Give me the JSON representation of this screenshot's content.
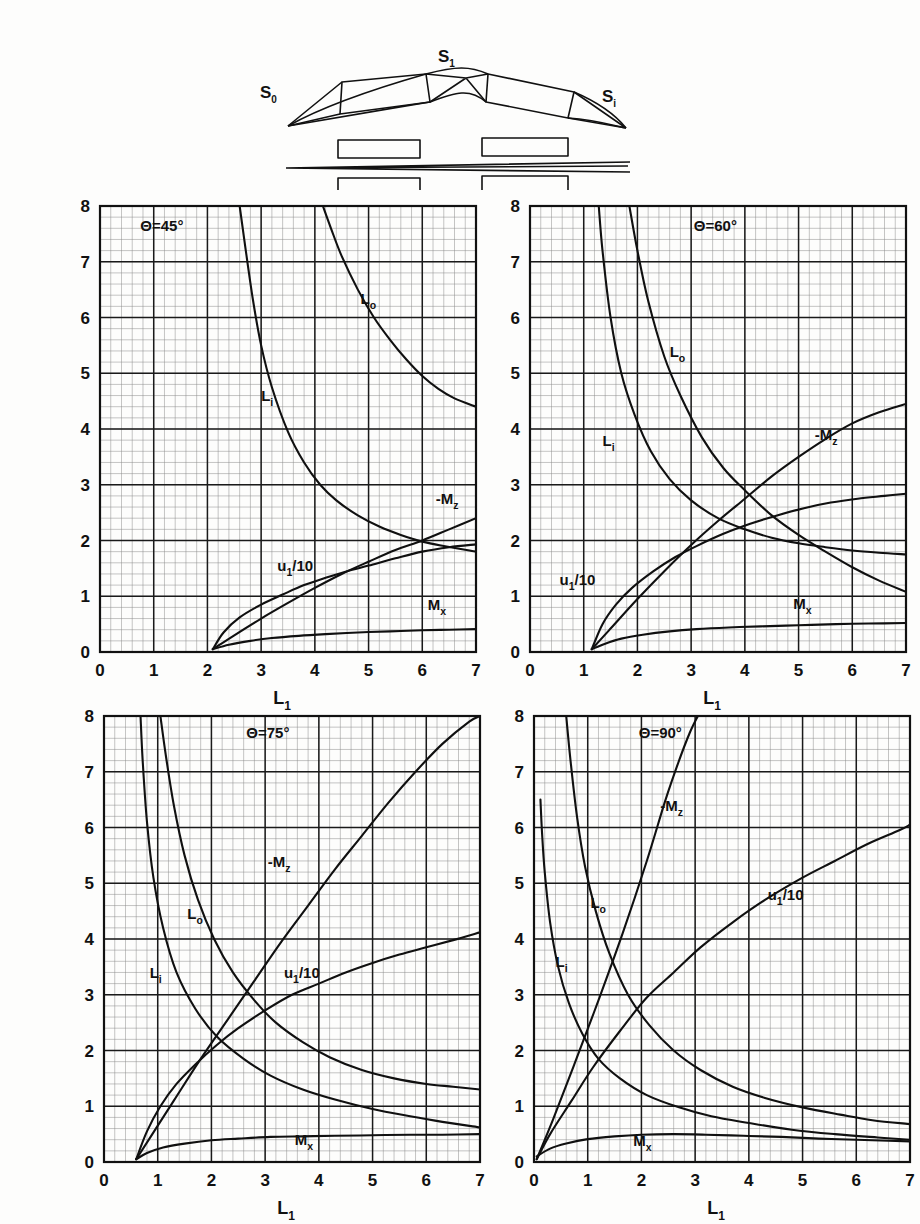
{
  "figure": {
    "schematic": {
      "labels": [
        {
          "name": "s-zero",
          "text": "S",
          "sub": "0",
          "x": 30,
          "y": 58
        },
        {
          "name": "s-one",
          "text": "S",
          "sub": "1",
          "x": 208,
          "y": 22
        },
        {
          "name": "s-i",
          "text": "S",
          "sub": "i",
          "x": 372,
          "y": 62
        }
      ]
    },
    "axis": {
      "x_label": "L",
      "x_label_sub": "1",
      "x_ticks": [
        "0",
        "1",
        "2",
        "3",
        "4",
        "5",
        "6",
        "7"
      ],
      "y_ticks": [
        "0",
        "1",
        "2",
        "3",
        "4",
        "5",
        "6",
        "7",
        "8"
      ],
      "x_min": 0,
      "x_max": 7,
      "y_min": 0,
      "y_max": 8,
      "minor_per_major": 5,
      "grid": "on"
    },
    "curve_names": {
      "lo": {
        "text": "L",
        "sub": "o"
      },
      "li": {
        "text": "L",
        "sub": "i"
      },
      "mz": {
        "text": "-M",
        "sub": "z"
      },
      "u1": {
        "text": "u",
        "sub": "1",
        "suffix": "/10"
      },
      "mx": {
        "text": "M",
        "sub": "x"
      }
    },
    "line_color": "#101010",
    "grid_major_color": "#1a1a1a",
    "grid_minor_color": "#8a8a8a"
  },
  "chart_data": [
    {
      "type": "line",
      "title": "Θ=45°",
      "theta": 45,
      "xlabel": "L₁",
      "ylabel": "",
      "xlim": [
        0,
        7
      ],
      "ylim": [
        0,
        8
      ],
      "grid": true,
      "origin_x": 2.1,
      "label_positions": {
        "theta": {
          "x": 0.75,
          "y": 7.55
        },
        "lo": {
          "x": 4.85,
          "y": 6.25
        },
        "li": {
          "x": 3.0,
          "y": 4.5
        },
        "mz": {
          "x": 6.25,
          "y": 2.65
        },
        "u1": {
          "x": 3.3,
          "y": 1.45
        },
        "mx": {
          "x": 6.1,
          "y": 0.75
        }
      },
      "series": [
        {
          "name": "L₀",
          "key": "lo",
          "x": [
            4.15,
            4.3,
            4.5,
            4.8,
            5.1,
            5.4,
            5.7,
            6.0,
            6.3,
            6.6,
            7.0
          ],
          "values": [
            8.0,
            7.6,
            7.1,
            6.5,
            6.0,
            5.6,
            5.25,
            4.95,
            4.72,
            4.55,
            4.4
          ]
        },
        {
          "name": "Lᵢ",
          "key": "li",
          "x": [
            2.6,
            2.7,
            2.85,
            3.0,
            3.2,
            3.5,
            3.8,
            4.1,
            4.4,
            4.8,
            5.2,
            5.6,
            6.0,
            6.4,
            7.0
          ],
          "values": [
            8.0,
            7.3,
            6.3,
            5.5,
            4.75,
            3.95,
            3.4,
            3.0,
            2.72,
            2.45,
            2.25,
            2.1,
            1.98,
            1.9,
            1.8
          ]
        },
        {
          "name": "-M_z",
          "key": "mz",
          "x": [
            2.1,
            2.5,
            3.0,
            3.5,
            4.0,
            4.5,
            5.0,
            5.5,
            6.0,
            6.5,
            7.0
          ],
          "values": [
            0.05,
            0.3,
            0.6,
            0.88,
            1.15,
            1.4,
            1.62,
            1.83,
            2.0,
            2.2,
            2.4
          ]
        },
        {
          "name": "u₁/10",
          "key": "u1",
          "x": [
            2.1,
            2.3,
            2.6,
            3.0,
            3.4,
            3.8,
            4.2,
            4.6,
            5.0,
            5.5,
            6.0,
            6.5,
            7.0
          ],
          "values": [
            0.05,
            0.35,
            0.62,
            0.85,
            1.03,
            1.2,
            1.33,
            1.45,
            1.55,
            1.68,
            1.8,
            1.88,
            1.93
          ]
        },
        {
          "name": "M_x",
          "key": "mx",
          "x": [
            2.1,
            2.4,
            2.8,
            3.2,
            3.7,
            4.2,
            4.8,
            5.4,
            6.0,
            6.5,
            7.0
          ],
          "values": [
            0.05,
            0.13,
            0.2,
            0.25,
            0.29,
            0.32,
            0.35,
            0.37,
            0.39,
            0.4,
            0.41
          ]
        }
      ]
    },
    {
      "type": "line",
      "title": "Θ=60°",
      "theta": 60,
      "xlabel": "L₁",
      "ylabel": "",
      "xlim": [
        0,
        7
      ],
      "ylim": [
        0,
        8
      ],
      "grid": true,
      "origin_x": 1.15,
      "label_positions": {
        "theta": {
          "x": 3.05,
          "y": 7.55
        },
        "lo": {
          "x": 2.6,
          "y": 5.3
        },
        "li": {
          "x": 1.35,
          "y": 3.7
        },
        "mz": {
          "x": 5.3,
          "y": 3.8
        },
        "u1": {
          "x": 0.55,
          "y": 1.2
        },
        "mx": {
          "x": 4.9,
          "y": 0.78
        }
      },
      "series": [
        {
          "name": "L₀",
          "key": "lo",
          "x": [
            1.85,
            2.0,
            2.2,
            2.5,
            2.8,
            3.2,
            3.6,
            4.0,
            4.5,
            5.0,
            5.5,
            6.0,
            6.5,
            7.0
          ],
          "values": [
            8.0,
            7.2,
            6.3,
            5.3,
            4.6,
            3.85,
            3.3,
            2.9,
            2.45,
            2.1,
            1.8,
            1.52,
            1.28,
            1.08
          ]
        },
        {
          "name": "Lᵢ",
          "key": "li",
          "x": [
            1.28,
            1.35,
            1.5,
            1.7,
            1.95,
            2.25,
            2.6,
            3.0,
            3.5,
            4.0,
            4.5,
            5.0,
            5.5,
            6.0,
            6.5,
            7.0
          ],
          "values": [
            8.0,
            7.2,
            6.0,
            5.0,
            4.25,
            3.6,
            3.1,
            2.72,
            2.4,
            2.2,
            2.05,
            1.95,
            1.88,
            1.82,
            1.78,
            1.75
          ]
        },
        {
          "name": "-M_z",
          "key": "mz",
          "x": [
            1.15,
            1.5,
            2.0,
            2.5,
            3.0,
            3.5,
            4.0,
            4.5,
            5.0,
            5.5,
            6.0,
            6.5,
            7.0
          ],
          "values": [
            0.05,
            0.42,
            0.95,
            1.45,
            1.92,
            2.35,
            2.75,
            3.15,
            3.5,
            3.82,
            4.1,
            4.3,
            4.45
          ]
        },
        {
          "name": "u₁/10",
          "key": "u1",
          "x": [
            1.15,
            1.35,
            1.6,
            1.9,
            2.3,
            2.7,
            3.1,
            3.6,
            4.1,
            4.6,
            5.1,
            5.6,
            6.1,
            6.6,
            7.0
          ],
          "values": [
            0.05,
            0.5,
            0.85,
            1.15,
            1.45,
            1.7,
            1.9,
            2.12,
            2.3,
            2.45,
            2.58,
            2.68,
            2.75,
            2.8,
            2.84
          ]
        },
        {
          "name": "M_x",
          "key": "mx",
          "x": [
            1.15,
            1.4,
            1.7,
            2.1,
            2.6,
            3.1,
            3.7,
            4.3,
            5.0,
            5.7,
            6.3,
            7.0
          ],
          "values": [
            0.05,
            0.15,
            0.24,
            0.31,
            0.37,
            0.41,
            0.44,
            0.46,
            0.48,
            0.5,
            0.51,
            0.52
          ]
        }
      ]
    },
    {
      "type": "line",
      "title": "Θ=75°",
      "theta": 75,
      "xlabel": "L₁",
      "ylabel": "",
      "xlim": [
        0,
        7
      ],
      "ylim": [
        0,
        8
      ],
      "grid": true,
      "origin_x": 0.6,
      "label_positions": {
        "theta": {
          "x": 2.65,
          "y": 7.6
        },
        "lo": {
          "x": 1.55,
          "y": 4.35
        },
        "li": {
          "x": 0.85,
          "y": 3.3
        },
        "mz": {
          "x": 3.05,
          "y": 5.3
        },
        "u1": {
          "x": 3.35,
          "y": 3.3
        },
        "mx": {
          "x": 3.55,
          "y": 0.3
        }
      },
      "series": [
        {
          "name": "L₀",
          "key": "lo",
          "x": [
            1.05,
            1.15,
            1.3,
            1.5,
            1.75,
            2.05,
            2.4,
            2.8,
            3.2,
            3.7,
            4.2,
            4.8,
            5.4,
            6.0,
            6.5,
            7.0
          ],
          "values": [
            8.0,
            7.3,
            6.4,
            5.5,
            4.7,
            4.0,
            3.4,
            2.9,
            2.5,
            2.15,
            1.88,
            1.65,
            1.5,
            1.4,
            1.35,
            1.3
          ]
        },
        {
          "name": "Lᵢ",
          "key": "li",
          "x": [
            0.68,
            0.72,
            0.8,
            0.92,
            1.1,
            1.35,
            1.7,
            2.1,
            2.6,
            3.1,
            3.7,
            4.3,
            5.0,
            5.7,
            6.3,
            7.0
          ],
          "values": [
            8.0,
            7.2,
            6.1,
            5.1,
            4.2,
            3.4,
            2.75,
            2.25,
            1.85,
            1.55,
            1.3,
            1.12,
            0.95,
            0.82,
            0.72,
            0.62
          ]
        },
        {
          "name": "-M_z",
          "key": "mz",
          "x": [
            0.6,
            0.9,
            1.3,
            1.8,
            2.3,
            2.8,
            3.3,
            3.8,
            4.3,
            4.8,
            5.3,
            5.8,
            6.3,
            6.8,
            7.0
          ],
          "values": [
            0.05,
            0.5,
            1.1,
            1.85,
            2.55,
            3.25,
            3.95,
            4.6,
            5.25,
            5.85,
            6.45,
            7.0,
            7.5,
            7.9,
            8.0
          ]
        },
        {
          "name": "u₁/10",
          "key": "u1",
          "x": [
            0.6,
            0.8,
            1.05,
            1.35,
            1.7,
            2.1,
            2.5,
            3.0,
            3.5,
            4.0,
            4.5,
            5.0,
            5.5,
            6.0,
            6.5,
            7.0
          ],
          "values": [
            0.05,
            0.55,
            1.0,
            1.4,
            1.75,
            2.1,
            2.4,
            2.72,
            3.0,
            3.2,
            3.4,
            3.57,
            3.72,
            3.85,
            3.98,
            4.12
          ]
        },
        {
          "name": "M_x",
          "key": "mx",
          "x": [
            0.6,
            0.8,
            1.1,
            1.5,
            2.0,
            2.5,
            3.1,
            3.7,
            4.3,
            5.0,
            5.7,
            6.3,
            7.0
          ],
          "values": [
            0.05,
            0.16,
            0.26,
            0.33,
            0.39,
            0.42,
            0.45,
            0.46,
            0.47,
            0.48,
            0.49,
            0.49,
            0.5
          ]
        }
      ]
    },
    {
      "type": "line",
      "title": "Θ=90°",
      "theta": 90,
      "xlabel": "L₁",
      "ylabel": "",
      "xlim": [
        0,
        7
      ],
      "ylim": [
        0,
        8
      ],
      "grid": true,
      "origin_x": 0.05,
      "label_positions": {
        "theta": {
          "x": 1.95,
          "y": 7.6
        },
        "lo": {
          "x": 1.05,
          "y": 4.55
        },
        "li": {
          "x": 0.4,
          "y": 3.5
        },
        "mz": {
          "x": 2.35,
          "y": 6.3
        },
        "u1": {
          "x": 4.35,
          "y": 4.7
        },
        "mx": {
          "x": 1.85,
          "y": 0.28
        }
      },
      "series": [
        {
          "name": "L₀",
          "key": "lo",
          "x": [
            0.6,
            0.68,
            0.8,
            0.95,
            1.15,
            1.4,
            1.75,
            2.15,
            2.6,
            3.1,
            3.7,
            4.3,
            5.0,
            5.7,
            6.3,
            7.0
          ],
          "values": [
            8.0,
            7.2,
            6.2,
            5.3,
            4.5,
            3.75,
            3.0,
            2.45,
            2.0,
            1.65,
            1.35,
            1.15,
            0.98,
            0.85,
            0.75,
            0.68
          ]
        },
        {
          "name": "Lᵢ",
          "key": "li",
          "x": [
            0.12,
            0.15,
            0.2,
            0.3,
            0.45,
            0.65,
            0.9,
            1.2,
            1.6,
            2.1,
            2.7,
            3.3,
            4.0,
            4.8,
            5.6,
            6.4,
            7.0
          ],
          "values": [
            6.5,
            5.9,
            5.2,
            4.3,
            3.5,
            2.85,
            2.3,
            1.85,
            1.5,
            1.2,
            0.98,
            0.82,
            0.7,
            0.58,
            0.5,
            0.44,
            0.4
          ]
        },
        {
          "name": "-M_z",
          "key": "mz",
          "x": [
            0.05,
            0.35,
            0.75,
            1.2,
            1.65,
            2.1,
            2.45,
            2.7,
            2.9,
            3.05
          ],
          "values": [
            0.05,
            0.75,
            1.75,
            2.9,
            4.1,
            5.4,
            6.5,
            7.2,
            7.7,
            8.0
          ]
        },
        {
          "name": "u₁/10",
          "key": "u1",
          "x": [
            0.05,
            0.3,
            0.7,
            1.1,
            1.6,
            2.1,
            2.6,
            3.1,
            3.7,
            4.3,
            5.0,
            5.6,
            6.2,
            6.8,
            7.0
          ],
          "values": [
            0.05,
            0.5,
            1.1,
            1.7,
            2.35,
            2.95,
            3.4,
            3.85,
            4.3,
            4.7,
            5.1,
            5.4,
            5.7,
            5.95,
            6.05
          ]
        },
        {
          "name": "M_x",
          "key": "mx",
          "x": [
            0.05,
            0.3,
            0.6,
            1.0,
            1.5,
            2.0,
            2.6,
            3.2,
            3.9,
            4.6,
            5.3,
            6.0,
            6.6,
            7.0
          ],
          "values": [
            0.1,
            0.24,
            0.33,
            0.41,
            0.46,
            0.49,
            0.5,
            0.49,
            0.47,
            0.45,
            0.42,
            0.4,
            0.38,
            0.37
          ]
        }
      ]
    }
  ]
}
